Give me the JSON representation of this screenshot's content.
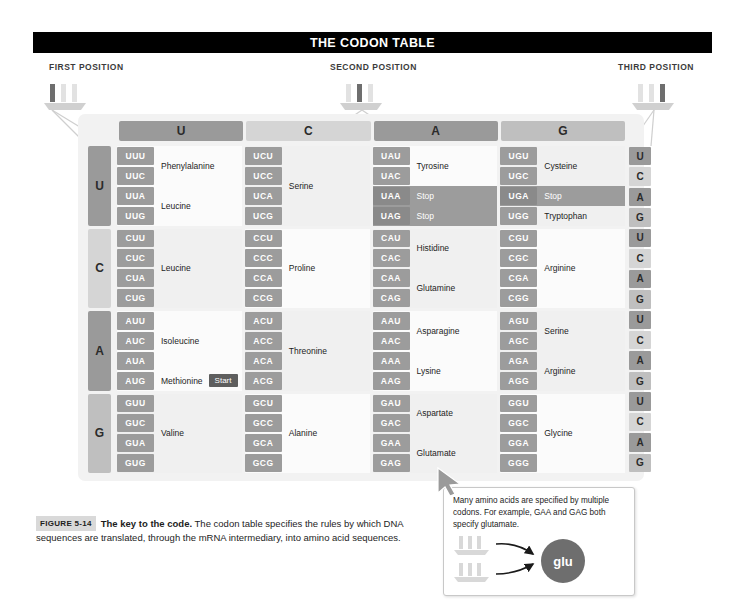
{
  "title": "THE CODON TABLE",
  "positions": {
    "first": "FIRST POSITION",
    "second": "SECOND POSITION",
    "third": "THIRD POSITION"
  },
  "column_headers": [
    "U",
    "C",
    "A",
    "G"
  ],
  "row_labels": [
    "U",
    "C",
    "A",
    "G"
  ],
  "third_position_column": [
    "U",
    "C",
    "A",
    "G",
    "U",
    "C",
    "A",
    "G",
    "U",
    "C",
    "A",
    "G",
    "U",
    "C",
    "A",
    "G"
  ],
  "codon_table": [
    {
      "first": "U",
      "blocks": [
        {
          "second": "U",
          "groups": [
            {
              "codons": [
                "UUU",
                "UUC"
              ],
              "amino_acid": "Phenylalanine",
              "stop": false
            },
            {
              "codons": [
                "UUA",
                "UUG"
              ],
              "amino_acid": "Leucine",
              "stop": false
            }
          ]
        },
        {
          "second": "C",
          "groups": [
            {
              "codons": [
                "UCU",
                "UCC",
                "UCA",
                "UCG"
              ],
              "amino_acid": "Serine",
              "stop": false
            }
          ]
        },
        {
          "second": "A",
          "groups": [
            {
              "codons": [
                "UAU",
                "UAC"
              ],
              "amino_acid": "Tyrosine",
              "stop": false
            },
            {
              "codons": [
                "UAA"
              ],
              "amino_acid": "Stop",
              "stop": true
            },
            {
              "codons": [
                "UAG"
              ],
              "amino_acid": "Stop",
              "stop": true
            }
          ]
        },
        {
          "second": "G",
          "groups": [
            {
              "codons": [
                "UGU",
                "UGC"
              ],
              "amino_acid": "Cysteine",
              "stop": false
            },
            {
              "codons": [
                "UGA"
              ],
              "amino_acid": "Stop",
              "stop": true
            },
            {
              "codons": [
                "UGG"
              ],
              "amino_acid": "Tryptophan",
              "stop": false
            }
          ]
        }
      ]
    },
    {
      "first": "C",
      "blocks": [
        {
          "second": "U",
          "groups": [
            {
              "codons": [
                "CUU",
                "CUC",
                "CUA",
                "CUG"
              ],
              "amino_acid": "Leucine",
              "stop": false
            }
          ]
        },
        {
          "second": "C",
          "groups": [
            {
              "codons": [
                "CCU",
                "CCC",
                "CCA",
                "CCG"
              ],
              "amino_acid": "Proline",
              "stop": false
            }
          ]
        },
        {
          "second": "A",
          "groups": [
            {
              "codons": [
                "CAU",
                "CAC"
              ],
              "amino_acid": "Histidine",
              "stop": false
            },
            {
              "codons": [
                "CAA",
                "CAG"
              ],
              "amino_acid": "Glutamine",
              "stop": false
            }
          ]
        },
        {
          "second": "G",
          "groups": [
            {
              "codons": [
                "CGU",
                "CGC",
                "CGA",
                "CGG"
              ],
              "amino_acid": "Arginine",
              "stop": false
            }
          ]
        }
      ]
    },
    {
      "first": "A",
      "blocks": [
        {
          "second": "U",
          "groups": [
            {
              "codons": [
                "AUU",
                "AUC",
                "AUA"
              ],
              "amino_acid": "Isoleucine",
              "stop": false
            },
            {
              "codons": [
                "AUG"
              ],
              "amino_acid": "Methionine",
              "stop": false,
              "badge": "Start"
            }
          ]
        },
        {
          "second": "C",
          "groups": [
            {
              "codons": [
                "ACU",
                "ACC",
                "ACA",
                "ACG"
              ],
              "amino_acid": "Threonine",
              "stop": false
            }
          ]
        },
        {
          "second": "A",
          "groups": [
            {
              "codons": [
                "AAU",
                "AAC"
              ],
              "amino_acid": "Asparagine",
              "stop": false
            },
            {
              "codons": [
                "AAA",
                "AAG"
              ],
              "amino_acid": "Lysine",
              "stop": false
            }
          ]
        },
        {
          "second": "G",
          "groups": [
            {
              "codons": [
                "AGU",
                "AGC"
              ],
              "amino_acid": "Serine",
              "stop": false
            },
            {
              "codons": [
                "AGA",
                "AGG"
              ],
              "amino_acid": "Arginine",
              "stop": false
            }
          ]
        }
      ]
    },
    {
      "first": "G",
      "blocks": [
        {
          "second": "U",
          "groups": [
            {
              "codons": [
                "GUU",
                "GUC",
                "GUA",
                "GUG"
              ],
              "amino_acid": "Valine",
              "stop": false
            }
          ]
        },
        {
          "second": "C",
          "groups": [
            {
              "codons": [
                "GCU",
                "GCC",
                "GCA",
                "GCG"
              ],
              "amino_acid": "Alanine",
              "stop": false
            }
          ]
        },
        {
          "second": "A",
          "groups": [
            {
              "codons": [
                "GAU",
                "GAC"
              ],
              "amino_acid": "Aspartate",
              "stop": false
            },
            {
              "codons": [
                "GAA",
                "GAG"
              ],
              "amino_acid": "Glutamate",
              "stop": false
            }
          ]
        },
        {
          "second": "G",
          "groups": [
            {
              "codons": [
                "GGU",
                "GGC",
                "GGA",
                "GGG"
              ],
              "amino_acid": "Glycine",
              "stop": false
            }
          ]
        }
      ]
    }
  ],
  "caption": {
    "figure_number": "FIGURE 5-14",
    "bold_lead": "The key to the code.",
    "body": " The codon table specifies the rules by which DNA sequences are translated, through the mRNA intermediary, into amino acid sequences."
  },
  "callout": {
    "text": "Many amino acids are specified by multiple codons. For example, GAA and GAG both specify glutamate.",
    "circle_label": "glu"
  },
  "colors": {
    "title_bar": "#000000",
    "shade_dark": "#9a9a9a",
    "shade_light": "#d5d5d5",
    "shade_mid": "#bfbfbf",
    "codon_chip": "#9c9c9c",
    "stop_row": "#9c9c9c",
    "start_badge": "#5e5e5e",
    "frame": "#f2f2f2",
    "glu_circle": "#6e6e6e"
  }
}
